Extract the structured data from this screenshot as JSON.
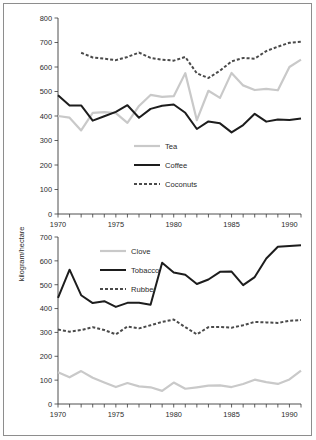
{
  "figure": {
    "background_color": "#ffffff",
    "border_color": "#8d8d8d",
    "axis_color": "#3a3a3a",
    "text_color": "#2b2b2b"
  },
  "axis_titles": {
    "y_shared": "kilogram/hectare"
  },
  "chart_data": [
    {
      "type": "line",
      "id": "top-chart",
      "title": "",
      "xlabel": "",
      "ylabel": "kilogram/hectare",
      "xlim": [
        1970,
        1991
      ],
      "ylim": [
        0,
        800
      ],
      "ytick_step": 100,
      "yticks": [
        0,
        100,
        200,
        300,
        400,
        500,
        600,
        700,
        800
      ],
      "xticks": [
        1970,
        1971,
        1972,
        1973,
        1974,
        1975,
        1976,
        1977,
        1978,
        1979,
        1980,
        1981,
        1982,
        1983,
        1984,
        1985,
        1986,
        1987,
        1988,
        1989,
        1990,
        1991
      ],
      "xtick_labels": [
        "1970",
        "",
        "",
        "",
        "",
        "1975",
        "",
        "",
        "",
        "",
        "1980",
        "",
        "",
        "",
        "",
        "1985",
        "",
        "",
        "",
        "",
        "1990",
        ""
      ],
      "grid": false,
      "legend_position": "center",
      "x": [
        1970,
        1971,
        1972,
        1973,
        1974,
        1975,
        1976,
        1977,
        1978,
        1979,
        1980,
        1981,
        1982,
        1983,
        1984,
        1985,
        1986,
        1987,
        1988,
        1989,
        1990,
        1991
      ],
      "series": [
        {
          "name": "Tea",
          "color": "#c9c9c9",
          "style": "solid",
          "width": 2.2,
          "values": [
            400,
            393,
            341,
            413,
            416,
            412,
            372,
            441,
            486,
            478,
            481,
            575,
            383,
            503,
            474,
            576,
            525,
            506,
            511,
            505,
            600,
            630
          ]
        },
        {
          "name": "Coffee",
          "color": "#1d1d1d",
          "style": "solid",
          "width": 2.0,
          "values": [
            485,
            443,
            443,
            381,
            399,
            417,
            444,
            393,
            429,
            442,
            447,
            413,
            347,
            378,
            370,
            333,
            363,
            409,
            377,
            386,
            384,
            390
          ]
        },
        {
          "name": "Coconuts",
          "color": "#4a4a4a",
          "style": "dashed",
          "width": 2.0,
          "values": [
            null,
            null,
            658,
            639,
            634,
            628,
            641,
            659,
            637,
            630,
            626,
            641,
            574,
            555,
            585,
            623,
            637,
            634,
            665,
            683,
            699,
            703
          ]
        }
      ]
    },
    {
      "type": "line",
      "id": "bottom-chart",
      "title": "",
      "xlabel": "",
      "ylabel": "kilogram/hectare",
      "xlim": [
        1970,
        1991
      ],
      "ylim": [
        0,
        700
      ],
      "ytick_step": 100,
      "yticks": [
        0,
        100,
        200,
        300,
        400,
        500,
        600,
        700
      ],
      "xticks": [
        1970,
        1971,
        1972,
        1973,
        1974,
        1975,
        1976,
        1977,
        1978,
        1979,
        1980,
        1981,
        1982,
        1983,
        1984,
        1985,
        1986,
        1987,
        1988,
        1989,
        1990,
        1991
      ],
      "xtick_labels": [
        "1970",
        "",
        "",
        "",
        "",
        "1975",
        "",
        "",
        "",
        "",
        "1980",
        "",
        "",
        "",
        "",
        "1985",
        "",
        "",
        "",
        "",
        "1990",
        ""
      ],
      "grid": false,
      "legend_position": "upper-left",
      "x": [
        1970,
        1971,
        1972,
        1973,
        1974,
        1975,
        1976,
        1977,
        1978,
        1979,
        1980,
        1981,
        1982,
        1983,
        1984,
        1985,
        1986,
        1987,
        1988,
        1989,
        1990,
        1991
      ],
      "series": [
        {
          "name": "Clove",
          "color": "#c9c9c9",
          "style": "solid",
          "width": 2.2,
          "values": [
            133,
            112,
            138,
            110,
            90,
            71,
            88,
            74,
            70,
            55,
            90,
            64,
            70,
            77,
            78,
            71,
            84,
            102,
            92,
            84,
            103,
            140
          ]
        },
        {
          "name": "Tobacco",
          "color": "#1d1d1d",
          "style": "solid",
          "width": 2.0,
          "values": [
            445,
            563,
            456,
            423,
            431,
            407,
            424,
            424,
            416,
            592,
            551,
            542,
            503,
            522,
            554,
            555,
            498,
            532,
            610,
            659,
            662,
            665
          ]
        },
        {
          "name": "Rubber",
          "color": "#4a4a4a",
          "style": "dashed",
          "width": 2.0,
          "values": [
            312,
            303,
            310,
            322,
            310,
            292,
            325,
            317,
            330,
            344,
            354,
            322,
            292,
            322,
            323,
            320,
            330,
            344,
            342,
            340,
            349,
            352
          ]
        }
      ]
    }
  ]
}
